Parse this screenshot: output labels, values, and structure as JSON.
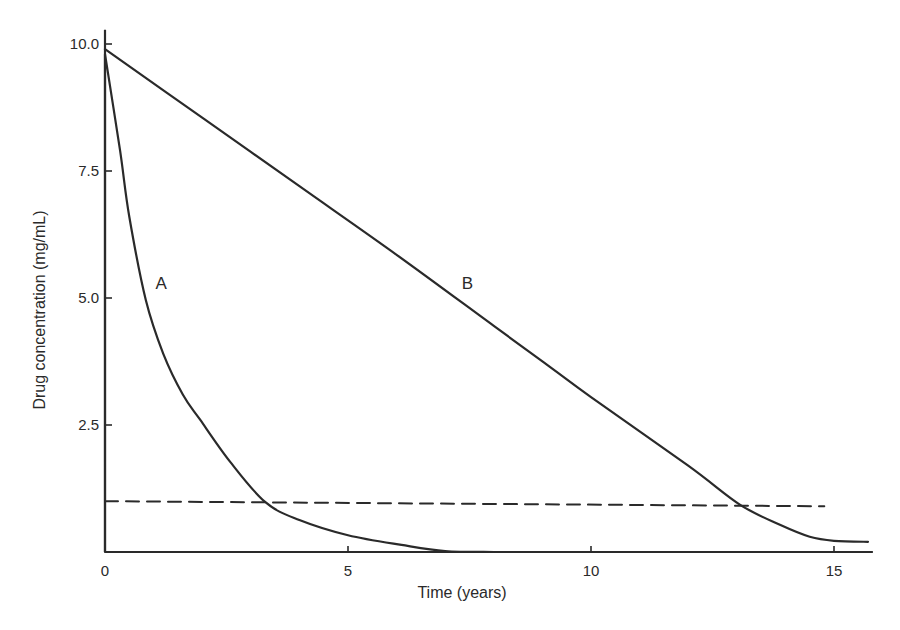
{
  "chart_data": {
    "type": "line",
    "title": "",
    "xlabel": "Time (years)",
    "ylabel": "Drug concentration (mg/mL)",
    "xlim": [
      0,
      15.8
    ],
    "ylim": [
      0,
      10.2
    ],
    "x_ticks": [
      0,
      5,
      10,
      15
    ],
    "x_tick_labels": [
      "0",
      "5",
      "10",
      "15"
    ],
    "y_ticks": [
      2.5,
      5.0,
      7.5,
      10.0
    ],
    "y_tick_labels": [
      "2.5",
      "5.0",
      "7.5",
      "10.0"
    ],
    "grid": false,
    "legend": "none (curves labelled inline)",
    "series": [
      {
        "name": "A",
        "label": "A",
        "style": "solid",
        "description": "Initial vertical rise to ~10 at t=0, then rapid first-order (exponential-like) decay",
        "x": [
          0,
          0,
          0.31,
          0.5,
          0.84,
          1.2,
          1.6,
          1.96,
          2.58,
          3.3,
          4.0,
          5.0,
          6.1,
          7.0,
          8.0
        ],
        "y": [
          0,
          9.8,
          7.9,
          6.6,
          4.96,
          3.9,
          3.1,
          2.6,
          1.77,
          0.98,
          0.63,
          0.33,
          0.14,
          0.02,
          0.0
        ]
      },
      {
        "name": "B",
        "label": "B",
        "style": "solid",
        "description": "Linear (zero-order) decline from ~10 to ~1 by 13 years, then tails off",
        "x": [
          0,
          2,
          4,
          6,
          8,
          9.16,
          10,
          12,
          13.07,
          13.9,
          14.5,
          15.0,
          15.7
        ],
        "y": [
          9.9,
          8.55,
          7.2,
          5.85,
          4.45,
          3.64,
          3.05,
          1.7,
          0.93,
          0.53,
          0.3,
          0.22,
          0.2
        ]
      },
      {
        "name": "threshold",
        "label": "",
        "style": "dashed",
        "description": "Horizontal dashed reference line at ~1.0 mg/mL",
        "x": [
          0,
          14.8
        ],
        "y": [
          1.0,
          0.9
        ]
      }
    ],
    "annotations": [
      {
        "text": "A",
        "x": 1.0,
        "y": 5.3
      },
      {
        "text": "B",
        "x": 7.3,
        "y": 5.3
      }
    ]
  },
  "axes": {
    "x_title": "Time (years)",
    "y_title": "Drug concentration (mg/mL)"
  }
}
